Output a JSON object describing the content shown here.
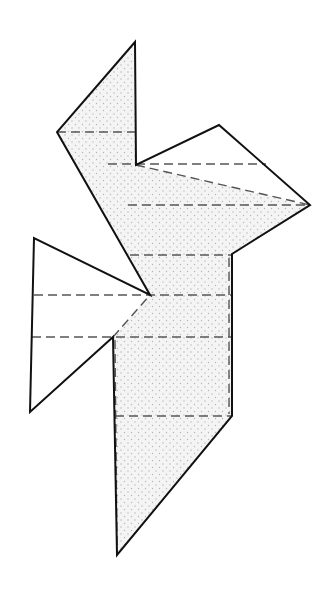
{
  "diagram": {
    "type": "origami-fold-diagram",
    "colors": {
      "outline": "#111111",
      "fold_line": "#555555",
      "shaded_fill": "#f4f4f4",
      "dot": "#b5b5b5",
      "background": "#ffffff"
    },
    "shaded_region": {
      "points": "135,42 136,165 310,205 232,254 232,416 117,555 113,337 150,295 57,132"
    },
    "outline": {
      "points": "135,42 136,165 219,125 310,205 232,254 232,416 117,555 113,337 30,412 34,238 150,295 57,132"
    },
    "white_flaps": [
      {
        "name": "upper-right-flap",
        "points": "136,165 219,125 310,205"
      },
      {
        "name": "left-flap",
        "points": "34,238 150,295 113,337 30,412"
      }
    ],
    "fold_lines": [
      {
        "name": "fold-line-1",
        "x1": 57,
        "y1": 132,
        "x2": 136,
        "y2": 132
      },
      {
        "name": "fold-line-2",
        "x1": 108,
        "y1": 164,
        "x2": 266,
        "y2": 164
      },
      {
        "name": "fold-line-3",
        "x1": 136,
        "y1": 165,
        "x2": 310,
        "y2": 205
      },
      {
        "name": "fold-line-4",
        "x1": 128,
        "y1": 205,
        "x2": 310,
        "y2": 205
      },
      {
        "name": "fold-line-5",
        "x1": 130,
        "y1": 255,
        "x2": 232,
        "y2": 255
      },
      {
        "name": "fold-line-6",
        "x1": 34,
        "y1": 295,
        "x2": 232,
        "y2": 295
      },
      {
        "name": "fold-line-7",
        "x1": 113,
        "y1": 337,
        "x2": 150,
        "y2": 295
      },
      {
        "name": "fold-line-8",
        "x1": 32,
        "y1": 337,
        "x2": 232,
        "y2": 337
      },
      {
        "name": "fold-line-9",
        "x1": 115,
        "y1": 416,
        "x2": 232,
        "y2": 416
      },
      {
        "name": "fold-line-10",
        "x1": 115,
        "y1": 340,
        "x2": 117,
        "y2": 552
      },
      {
        "name": "fold-line-11",
        "x1": 229,
        "y1": 258,
        "x2": 229,
        "y2": 414
      }
    ]
  }
}
